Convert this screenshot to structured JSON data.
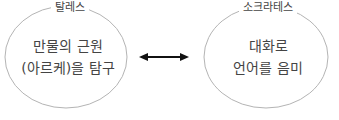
{
  "diagram": {
    "left": {
      "title": "탈레스",
      "line1": "만물의 근원",
      "line2": "(아르케)을 탐구"
    },
    "right": {
      "title": "소크라테스",
      "line1": "대화로",
      "line2": "언어를 음미"
    },
    "connector": "bidirectional-arrow",
    "colors": {
      "ellipse_stroke": "#b4b4b4",
      "arrow": "#111111",
      "text": "#444444"
    }
  }
}
